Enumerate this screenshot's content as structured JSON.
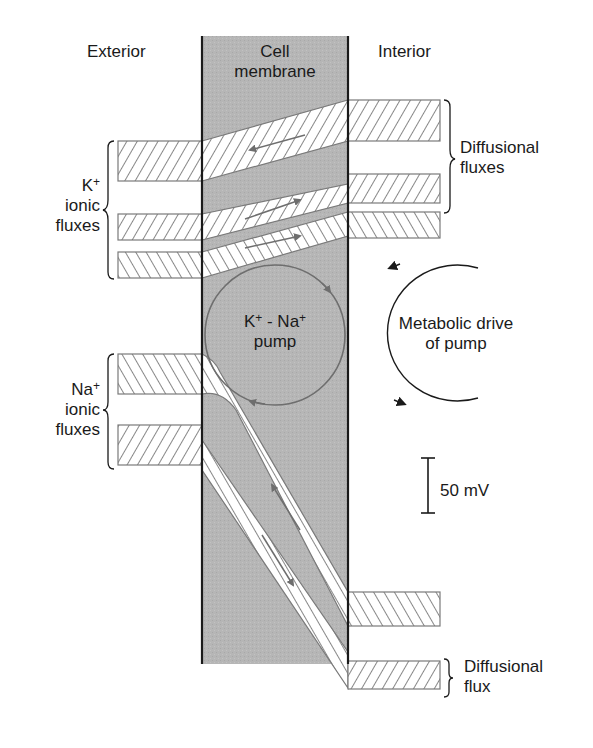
{
  "diagram": {
    "regions": {
      "exterior": "Exterior",
      "membrane_line1": "Cell",
      "membrane_line2": "membrane",
      "interior": "Interior"
    },
    "labels": {
      "k_ion": "K",
      "k_sup": "+",
      "k_line2": "ionic",
      "k_line3": "fluxes",
      "na_ion": "Na",
      "na_sup": "+",
      "na_line2": "ionic",
      "na_line3": "fluxes",
      "diffusional_fluxes_line1": "Diffusional",
      "diffusional_fluxes_line2": "fluxes",
      "pump_k": "K",
      "pump_k_sup": "+",
      "pump_sep": " - Na",
      "pump_na_sup": "+",
      "pump_line2": "pump",
      "metabolic_line1": "Metabolic drive",
      "metabolic_line2": "of pump",
      "scale_bar": "50 mV",
      "diffusional_flux_line1": "Diffusional",
      "diffusional_flux_line2": "flux"
    },
    "colors": {
      "membrane_fill": "#b4b4b4",
      "hatch_stroke": "#6a6a6a",
      "band_edge": "#7a7a7a",
      "pump_circle": "#6e6e6e",
      "line": "#1a1a1a"
    }
  }
}
